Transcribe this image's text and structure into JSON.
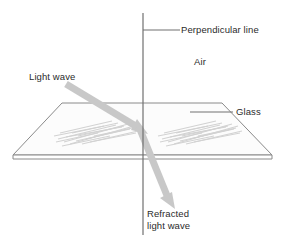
{
  "diagram": {
    "background_color": "#ffffff",
    "labels": {
      "perpendicular_line": "Perpendicular line",
      "air": "Air",
      "glass": "Glass",
      "light_wave": "Light wave",
      "refracted_light_wave": "Refracted\nlight wave"
    },
    "colors": {
      "line": "#6b6b6b",
      "outline": "#8a8a8a",
      "ray": "#c6c6c6",
      "hatch": "#cfcfcf",
      "glass_fill": "#fbfbfb",
      "text": "#2b2b2b"
    },
    "elements": {
      "perpendicular_line": {
        "name": "perpendicular-line",
        "x": 143,
        "y_top": 13,
        "y_bottom": 235
      },
      "perpendicular_leader": {
        "name": "perpendicular-leader-line",
        "x_start": 143,
        "x_end": 180,
        "y": 30
      },
      "glass_slab": {
        "name": "glass-slab",
        "top_left": [
          62,
          103
        ],
        "top_right": [
          222,
          103
        ],
        "bottom_right": [
          272,
          155
        ],
        "bottom_left": [
          13,
          155
        ],
        "thickness": 4
      },
      "glass_leader": {
        "name": "glass-leader-line",
        "x_start": 190,
        "x_end": 233,
        "y": 112
      },
      "incident_ray": {
        "name": "incident-light-ray",
        "from": [
          66,
          84
        ],
        "to": [
          143,
          131
        ],
        "arrowhead": "down-right"
      },
      "refracted_ray": {
        "name": "refracted-light-ray",
        "from": [
          140,
          129
        ],
        "to": [
          173,
          207
        ],
        "arrowhead": "down-right"
      },
      "hatch_left": {
        "name": "glass-hatch-left",
        "center": [
          93,
          131
        ]
      },
      "hatch_right": {
        "name": "glass-hatch-right",
        "center": [
          195,
          131
        ]
      }
    }
  }
}
